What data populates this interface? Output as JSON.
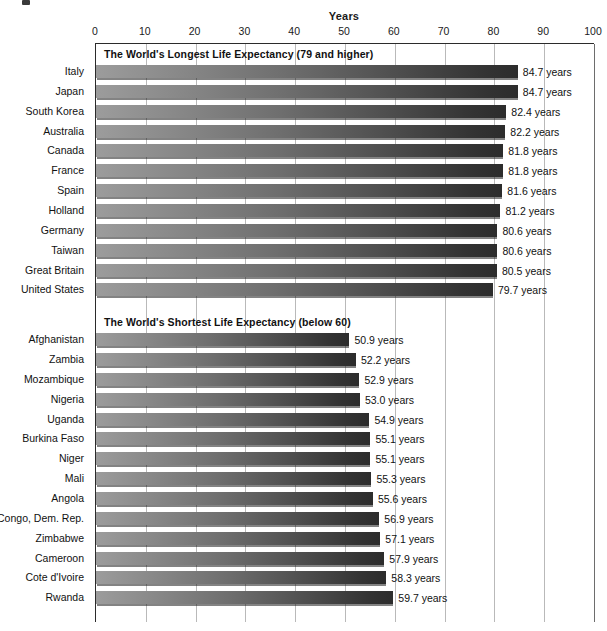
{
  "chart_data": {
    "type": "bar",
    "orientation": "horizontal",
    "title": "",
    "xlabel": "Years",
    "ylabel": "",
    "xlim": [
      0,
      100
    ],
    "xticks": [
      0,
      10,
      20,
      30,
      40,
      50,
      60,
      70,
      80,
      90,
      100
    ],
    "grid": true,
    "legend": "none",
    "value_suffix": "years",
    "groups": [
      {
        "band_label": "The World's Longest Life Expectancy (79 and higher)",
        "categories": [
          "Italy",
          "Japan",
          "South Korea",
          "Australia",
          "Canada",
          "France",
          "Spain",
          "Holland",
          "Germany",
          "Taiwan",
          "Great Britain",
          "United States"
        ],
        "values": [
          84.7,
          84.7,
          82.4,
          82.2,
          81.8,
          81.8,
          81.6,
          81.2,
          80.6,
          80.6,
          80.5,
          79.7
        ],
        "value_labels": [
          "84.7 years",
          "84.7 years",
          "82.4 years",
          "82.2 years",
          "81.8 years",
          "81.8 years",
          "81.6 years",
          "81.2 years",
          "80.6 years",
          "80.6 years",
          "80.5 years",
          "79.7 years"
        ]
      },
      {
        "band_label": "The World's Shortest Life Expectancy (below 60)",
        "categories": [
          "Afghanistan",
          "Zambia",
          "Mozambique",
          "Nigeria",
          "Uganda",
          "Burkina Faso",
          "Niger",
          "Mali",
          "Angola",
          "Congo, Dem. Rep.",
          "Zimbabwe",
          "Cameroon",
          "Cote d'Ivoire",
          "Rwanda"
        ],
        "values": [
          50.9,
          52.2,
          52.9,
          53.0,
          54.9,
          55.1,
          55.1,
          55.3,
          55.6,
          56.9,
          57.1,
          57.9,
          58.3,
          59.7
        ],
        "value_labels": [
          "50.9 years",
          "52.2 years",
          "52.9 years",
          "53.0 years",
          "54.9 years",
          "55.1 years",
          "55.1 years",
          "55.3 years",
          "55.6 years",
          "56.9 years",
          "57.1 years",
          "57.9 years",
          "58.3 years",
          "59.7 years"
        ]
      }
    ],
    "colors": {
      "bar_gradient_start": "#9c9c9c",
      "bar_gradient_end": "#2c2c2c",
      "axis": "#2b2b2b",
      "gridline": "#b9b9b9",
      "text": "#111111",
      "background": "#ffffff"
    }
  }
}
